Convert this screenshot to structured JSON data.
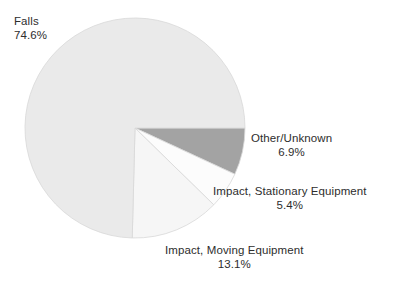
{
  "chart_data": {
    "type": "pie",
    "title": "",
    "subtitle": "",
    "xlabel": "",
    "ylabel": "",
    "legend_position": "none",
    "grid": false,
    "start_angle_deg": 0,
    "direction": "clockwise",
    "categories": [
      "Other/Unknown",
      "Impact, Stationary Equipment",
      "Impact, Moving Equipment",
      "Falls"
    ],
    "values": [
      6.9,
      5.4,
      13.1,
      74.6
    ],
    "units": "percent",
    "total": 100.0,
    "slices": [
      {
        "label": "Other/Unknown",
        "value": 6.9,
        "value_text": "6.9%",
        "color": "#a3a3a3",
        "start_deg": 0.0,
        "end_deg": 24.84
      },
      {
        "label": "Impact, Stationary Equipment",
        "value": 5.4,
        "value_text": "5.4%",
        "color": "#fcfcfc",
        "start_deg": 24.84,
        "end_deg": 44.28
      },
      {
        "label": "Impact, Moving Equipment",
        "value": 13.1,
        "value_text": "13.1%",
        "color": "#f6f6f6",
        "start_deg": 44.28,
        "end_deg": 91.44
      },
      {
        "label": "Falls",
        "value": 74.6,
        "value_text": "74.6%",
        "color": "#eaeaea",
        "start_deg": 91.44,
        "end_deg": 360.0
      }
    ]
  },
  "labels": {
    "falls": {
      "name": "Falls",
      "pct": "74.6%"
    },
    "other": {
      "name": "Other/Unknown",
      "pct": "6.9%"
    },
    "stationary": {
      "name": "Impact, Stationary Equipment",
      "pct": "5.4%"
    },
    "moving": {
      "name": "Impact, Moving Equipment",
      "pct": "13.1%"
    }
  },
  "geometry": {
    "center_x": 135,
    "center_y": 128,
    "radius": 110
  },
  "colors": {
    "background": "#ffffff",
    "text": "#2d2d2d",
    "slice_edge": "#d8d8d8"
  }
}
